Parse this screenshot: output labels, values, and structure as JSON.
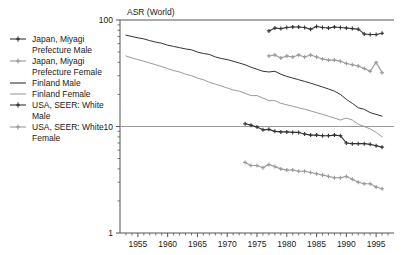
{
  "chart_data": {
    "type": "line",
    "title": "ASR (World)",
    "xlabel": "",
    "ylabel": "ASR (World)",
    "yscale": "log",
    "ylim": [
      1,
      100
    ],
    "xlim": [
      1952,
      1998
    ],
    "grid": false,
    "legend_position": "left-outside",
    "y_ticks": [
      "100",
      "10",
      "1"
    ],
    "y_tick_values": [
      100,
      10,
      1
    ],
    "x_ticks": [
      "1955",
      "1960",
      "1965",
      "1970",
      "1975",
      "1980",
      "1985",
      "1990",
      "1995"
    ],
    "x_tick_values": [
      1955,
      1960,
      1965,
      1970,
      1975,
      1980,
      1985,
      1990,
      1995
    ],
    "x_minor_tick_step": 1,
    "series": [
      {
        "name": "Japan, Miyagi Prefecture Male",
        "color": "#333333",
        "marker": "plus",
        "x": [
          1973,
          1974,
          1975,
          1976,
          1977,
          1978,
          1979,
          1980,
          1981,
          1982,
          1983,
          1984,
          1985,
          1986,
          1987,
          1988,
          1989,
          1990,
          1991,
          1992,
          1993,
          1994,
          1995,
          1996
        ],
        "values": [
          10.6,
          10.3,
          9.9,
          9.3,
          9.4,
          9.0,
          8.9,
          8.9,
          8.8,
          8.8,
          8.5,
          8.3,
          8.3,
          8.2,
          8.2,
          8.3,
          8.2,
          7.0,
          6.9,
          6.9,
          6.9,
          6.8,
          6.6,
          6.4
        ]
      },
      {
        "name": "Japan, Miyagi Prefecture Female",
        "color": "#9a9a9a",
        "marker": "plus",
        "x": [
          1973,
          1974,
          1975,
          1976,
          1977,
          1978,
          1979,
          1980,
          1981,
          1982,
          1983,
          1984,
          1985,
          1986,
          1987,
          1988,
          1989,
          1990,
          1991,
          1992,
          1993,
          1994,
          1995,
          1996
        ],
        "values": [
          4.6,
          4.3,
          4.3,
          4.1,
          4.4,
          4.2,
          4.0,
          3.9,
          3.9,
          3.8,
          3.8,
          3.7,
          3.6,
          3.5,
          3.4,
          3.3,
          3.3,
          3.4,
          3.2,
          3.0,
          2.9,
          2.9,
          2.7,
          2.6
        ]
      },
      {
        "name": "Finland Male",
        "color": "#333333",
        "marker": "none",
        "x": [
          1953,
          1954,
          1955,
          1956,
          1957,
          1958,
          1959,
          1960,
          1961,
          1962,
          1963,
          1964,
          1965,
          1966,
          1967,
          1968,
          1969,
          1970,
          1971,
          1972,
          1973,
          1974,
          1975,
          1976,
          1977,
          1978,
          1979,
          1980,
          1981,
          1982,
          1983,
          1984,
          1985,
          1986,
          1987,
          1988,
          1989,
          1990,
          1991,
          1992,
          1993,
          1994,
          1995,
          1996
        ],
        "values": [
          72,
          70,
          68,
          66.5,
          64,
          62,
          60.5,
          58,
          56.5,
          55,
          53.5,
          52.5,
          50,
          48.5,
          47.5,
          45,
          43.5,
          42.5,
          41,
          39.5,
          38,
          36,
          34.5,
          33,
          32.5,
          33,
          31,
          29.5,
          28.5,
          27.5,
          26.5,
          25.5,
          24.5,
          23.5,
          22.5,
          21.5,
          20,
          18,
          16.5,
          15,
          14.5,
          13.5,
          13,
          12.5
        ]
      },
      {
        "name": "Finland Female",
        "color": "#9a9a9a",
        "marker": "none",
        "x": [
          1953,
          1954,
          1955,
          1956,
          1957,
          1958,
          1959,
          1960,
          1961,
          1962,
          1963,
          1964,
          1965,
          1966,
          1967,
          1968,
          1969,
          1970,
          1971,
          1972,
          1973,
          1974,
          1975,
          1976,
          1977,
          1978,
          1979,
          1980,
          1981,
          1982,
          1983,
          1984,
          1985,
          1986,
          1987,
          1988,
          1989,
          1990,
          1991,
          1992,
          1993,
          1994,
          1995,
          1996
        ],
        "values": [
          46,
          44,
          42.5,
          41,
          39.5,
          38,
          36.5,
          35,
          33.5,
          32.5,
          31,
          30,
          28.5,
          27.5,
          26,
          25,
          24,
          23,
          22,
          21.5,
          20.5,
          19.5,
          19.5,
          18.5,
          17.5,
          17.5,
          16.5,
          16,
          15.5,
          15,
          14.5,
          14,
          13.5,
          13,
          12.5,
          12,
          11.5,
          12,
          11.5,
          10.5,
          10,
          9.5,
          8.8,
          8.0
        ]
      },
      {
        "name": "USA, SEER: White Male",
        "color": "#333333",
        "marker": "plus",
        "x": [
          1977,
          1978,
          1979,
          1980,
          1981,
          1982,
          1983,
          1984,
          1985,
          1986,
          1987,
          1988,
          1989,
          1990,
          1991,
          1992,
          1993,
          1994,
          1995,
          1996
        ],
        "values": [
          79,
          84,
          83,
          85,
          86,
          86,
          85,
          82,
          87,
          85,
          84,
          86,
          85,
          84,
          83,
          82,
          74,
          73,
          73,
          75
        ]
      },
      {
        "name": "USA, SEER: White Female",
        "color": "#9a9a9a",
        "marker": "plus",
        "x": [
          1977,
          1978,
          1979,
          1980,
          1981,
          1982,
          1983,
          1984,
          1985,
          1986,
          1987,
          1988,
          1989,
          1990,
          1991,
          1992,
          1993,
          1994,
          1995,
          1996
        ],
        "values": [
          46,
          47,
          44,
          46,
          45,
          47,
          45,
          47,
          45,
          43,
          42,
          42,
          41,
          39,
          38,
          37,
          35,
          33,
          40,
          32
        ]
      }
    ]
  },
  "legend": {
    "items": [
      {
        "label_line1": "Japan, Miyagi",
        "label_line2": "Prefecture Male",
        "color": "#333333",
        "marker": "plus"
      },
      {
        "label_line1": "Japan, Miyagi",
        "label_line2": "Prefecture Female",
        "color": "#9a9a9a",
        "marker": "plus"
      },
      {
        "label_line1": "Finland Male",
        "label_line2": "",
        "color": "#333333",
        "marker": "none"
      },
      {
        "label_line1": "Finland Female",
        "label_line2": "",
        "color": "#9a9a9a",
        "marker": "none"
      },
      {
        "label_line1": "USA, SEER: White",
        "label_line2": "Male",
        "color": "#333333",
        "marker": "plus"
      },
      {
        "label_line1": "USA, SEER: White",
        "label_line2": "Female",
        "color": "#9a9a9a",
        "marker": "plus"
      }
    ]
  },
  "colors": {
    "dark_series": "#333333",
    "light_series": "#9a9a9a",
    "axis": "#555555",
    "background": "#ffffff"
  }
}
